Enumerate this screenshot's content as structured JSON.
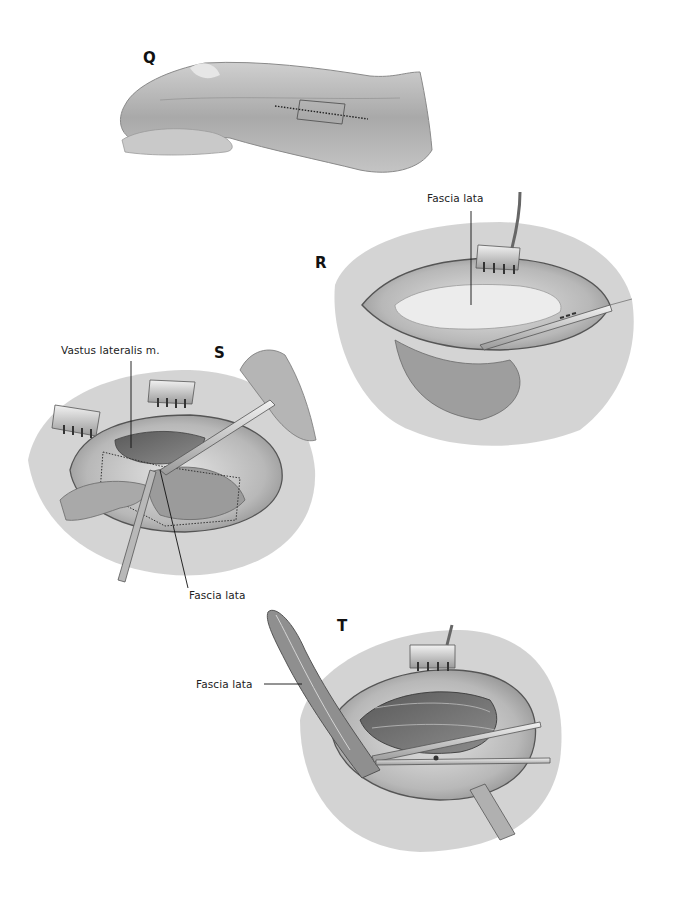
{
  "figure": {
    "panels": [
      {
        "id": "Q",
        "letter": "Q",
        "description": "Lateral thigh with marked incision line and rectangular fascia outline"
      },
      {
        "id": "R",
        "letter": "R",
        "description": "Incision opened with retractor, scalpel over exposed fascia",
        "labels": [
          "Fascia lata"
        ]
      },
      {
        "id": "S",
        "letter": "S",
        "description": "Fascia strip outlined and cut with scalpel, two retractors",
        "labels": [
          "Vastus lateralis m.",
          "Fascia lata"
        ]
      },
      {
        "id": "T",
        "letter": "T",
        "description": "Fascia strip elevated with forceps, scissors dividing end",
        "labels": [
          "Fascia lata"
        ]
      }
    ]
  },
  "labels": {
    "q_letter": "Q",
    "r_letter": "R",
    "s_letter": "S",
    "t_letter": "T",
    "r_fascia_lata": "Fascia lata",
    "s_vastus_lateralis": "Vastus lateralis m.",
    "s_fascia_lata": "Fascia lata",
    "t_fascia_lata": "Fascia lata"
  },
  "colors": {
    "background": "#ffffff",
    "ink": "#111111",
    "skin_light": "#d9d9d9",
    "skin_mid": "#a8a8a8",
    "tissue_dark": "#6e6e6e"
  }
}
